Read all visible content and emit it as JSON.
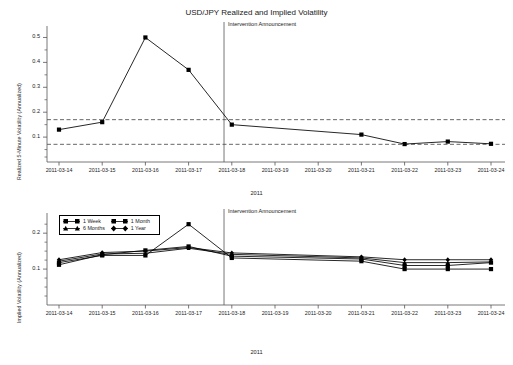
{
  "figure": {
    "title": "USD/JPY Realized and Implied Volatility",
    "xlabel": "2011",
    "annotation": "Intervention Announcement"
  },
  "chart_data": [
    {
      "type": "line",
      "panel": "top",
      "title": "USD/JPY Realized and Implied Volatility",
      "xlabel": "2011",
      "ylabel": "Realized 5-Minute Volatility (Annualized)",
      "categories": [
        "2011-03-14",
        "2011-03-15",
        "2011-03-16",
        "2011-03-17",
        "2011-03-18",
        "2011-03-19",
        "2011-03-20",
        "2011-03-21",
        "2011-03-22",
        "2011-03-23",
        "2011-03-24"
      ],
      "xticklabels": [
        "2011-03-14",
        "2011-03-15",
        "2011-03-16",
        "2011-03-17",
        "2011-03-18",
        "2011-03-19",
        "2011-03-20",
        "2011-03-21",
        "2011-03-22",
        "2011-03-23",
        "2011-03-24"
      ],
      "yticks": [
        0.1,
        0.2,
        0.3,
        0.4,
        0.5
      ],
      "yticklabels": [
        "0.1",
        "0.2",
        "0.3",
        "0.4",
        "0.5"
      ],
      "ylim": [
        0.0,
        0.53
      ],
      "grid": false,
      "series": [
        {
          "name": "Realized 5-Minute Volatility",
          "marker": "square",
          "x": [
            "2011-03-14",
            "2011-03-15",
            "2011-03-16",
            "2011-03-17",
            "2011-03-18",
            "2011-03-21",
            "2011-03-22",
            "2011-03-23",
            "2011-03-24"
          ],
          "values": [
            0.13,
            0.16,
            0.5,
            0.37,
            0.15,
            0.11,
            0.072,
            0.082,
            0.073
          ]
        }
      ],
      "reference_lines": [
        {
          "name": "upper-dashed-reference",
          "y": 0.17,
          "style": "dashed"
        },
        {
          "name": "lower-dashed-reference",
          "y": 0.071,
          "style": "dashed"
        }
      ],
      "vline": {
        "label": "Intervention Announcement",
        "x": "2011-03-18",
        "offset_days": -0.18
      },
      "legend": null
    },
    {
      "type": "line",
      "panel": "bottom",
      "xlabel": "2011",
      "ylabel": "Implied Volatility (Annualized)",
      "categories": [
        "2011-03-14",
        "2011-03-15",
        "2011-03-16",
        "2011-03-17",
        "2011-03-18",
        "2011-03-19",
        "2011-03-20",
        "2011-03-21",
        "2011-03-22",
        "2011-03-23",
        "2011-03-24"
      ],
      "xticklabels": [
        "2011-03-14",
        "2011-03-15",
        "2011-03-16",
        "2011-03-17",
        "2011-03-18",
        "2011-03-19",
        "2011-03-20",
        "2011-03-21",
        "2011-03-22",
        "2011-03-23",
        "2011-03-24"
      ],
      "yticks": [
        0.1,
        0.2
      ],
      "yticklabels": [
        "0.1",
        "0.2"
      ],
      "ylim": [
        0.0,
        0.245
      ],
      "grid": false,
      "legend_position": "upper left",
      "series": [
        {
          "name": "1 Week",
          "marker": "square",
          "x": [
            "2011-03-14",
            "2011-03-15",
            "2011-03-16",
            "2011-03-17",
            "2011-03-18",
            "2011-03-21",
            "2011-03-22",
            "2011-03-23",
            "2011-03-24"
          ],
          "values": [
            0.118,
            0.138,
            0.138,
            0.225,
            0.131,
            0.122,
            0.1,
            0.1,
            0.1
          ]
        },
        {
          "name": "1 Month",
          "marker": "square",
          "x": [
            "2011-03-14",
            "2011-03-15",
            "2011-03-16",
            "2011-03-17",
            "2011-03-18",
            "2011-03-21",
            "2011-03-22",
            "2011-03-23",
            "2011-03-24"
          ],
          "values": [
            0.112,
            0.14,
            0.152,
            0.163,
            0.136,
            0.128,
            0.11,
            0.11,
            0.118
          ]
        },
        {
          "name": "6 Months",
          "marker": "triangle",
          "x": [
            "2011-03-14",
            "2011-03-15",
            "2011-03-16",
            "2011-03-17",
            "2011-03-18",
            "2011-03-21",
            "2011-03-22",
            "2011-03-23",
            "2011-03-24"
          ],
          "values": [
            0.122,
            0.142,
            0.144,
            0.158,
            0.141,
            0.131,
            0.118,
            0.118,
            0.12
          ]
        },
        {
          "name": "1 Year",
          "marker": "diamond",
          "x": [
            "2011-03-14",
            "2011-03-15",
            "2011-03-16",
            "2011-03-17",
            "2011-03-18",
            "2011-03-21",
            "2011-03-22",
            "2011-03-23",
            "2011-03-24"
          ],
          "values": [
            0.126,
            0.146,
            0.15,
            0.16,
            0.145,
            0.134,
            0.126,
            0.126,
            0.126
          ]
        }
      ],
      "vline": {
        "label": "Intervention Announcement",
        "x": "2011-03-18",
        "offset_days": -0.18
      }
    }
  ],
  "top_panel": {
    "ylabel": "Realized 5-Minute Volatility (Annualized)",
    "xlabel": "2011",
    "annotation": "Intervention Announcement",
    "yticklabels": [
      "0.1",
      "0.2",
      "0.3",
      "0.4",
      "0.5"
    ],
    "xticklabels": [
      "2011-03-14",
      "2011-03-15",
      "2011-03-16",
      "2011-03-17",
      "2011-03-18",
      "2011-03-19",
      "2011-03-20",
      "2011-03-21",
      "2011-03-22",
      "2011-03-23",
      "2011-03-24"
    ]
  },
  "bottom_panel": {
    "ylabel": "Implied Volatility (Annualized)",
    "xlabel": "2011",
    "annotation": "Intervention Announcement",
    "yticklabels": [
      "0.1",
      "0.2"
    ],
    "xticklabels": [
      "2011-03-14",
      "2011-03-15",
      "2011-03-16",
      "2011-03-17",
      "2011-03-18",
      "2011-03-19",
      "2011-03-20",
      "2011-03-21",
      "2011-03-22",
      "2011-03-23",
      "2011-03-24"
    ],
    "legend": {
      "items": [
        "1 Week",
        "1 Month",
        "6 Months",
        "1 Year"
      ]
    }
  },
  "colors": {
    "line": "#000000",
    "axis": "#555555",
    "dashed": "#555555",
    "text": "#222222",
    "background": "#ffffff"
  }
}
